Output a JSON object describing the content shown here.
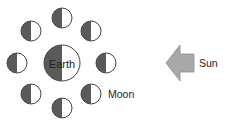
{
  "diagram": {
    "type": "moon-phases-orbit",
    "earth": {
      "label": "Earth",
      "cx": 62,
      "cy": 63,
      "r": 18
    },
    "moon_label": "Moon",
    "sun_label": "Sun",
    "colors": {
      "dark_half": "#5a5a5a",
      "light_half": "#ffffff",
      "outline": "#444444",
      "arrow_fill": "#a8a8a8",
      "arrow_stroke": "#8f8f8f"
    },
    "moons": [
      {
        "position": "top",
        "cx": 62,
        "cy": 18
      },
      {
        "position": "top-right",
        "cx": 91,
        "cy": 31
      },
      {
        "position": "right",
        "cx": 106,
        "cy": 63
      },
      {
        "position": "bottom-right",
        "cx": 91,
        "cy": 94
      },
      {
        "position": "bottom",
        "cx": 62,
        "cy": 108
      },
      {
        "position": "bottom-left",
        "cx": 31,
        "cy": 94
      },
      {
        "position": "left",
        "cx": 17,
        "cy": 63
      },
      {
        "position": "top-left",
        "cx": 31,
        "cy": 31
      }
    ],
    "moon_radius": 10
  }
}
